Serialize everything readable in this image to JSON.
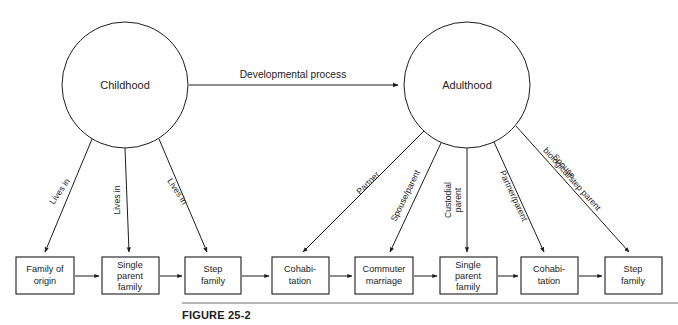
{
  "figure": {
    "caption": "FIGURE 25-2",
    "accent_color": "#1c1c1c",
    "rule_color": "#6f6f6f",
    "background": "#ffffff"
  },
  "nodes": [
    {
      "id": "childhood",
      "label": "Childhood",
      "shape": "circle",
      "cx": 125,
      "cy": 85,
      "r": 63
    },
    {
      "id": "adulthood",
      "label": "Adulthood",
      "shape": "circle",
      "cx": 467,
      "cy": 85,
      "r": 63
    }
  ],
  "main_edge": {
    "label": "Developmental process",
    "from": "childhood",
    "to": "adulthood"
  },
  "boxes": [
    {
      "id": "family-of-origin",
      "lines": [
        "Family of",
        "origin"
      ],
      "x": 16,
      "y": 257,
      "w": 58,
      "h": 37
    },
    {
      "id": "single-parent-1",
      "lines": [
        "Single",
        "parent",
        "family"
      ],
      "x": 102,
      "y": 257,
      "w": 57,
      "h": 37
    },
    {
      "id": "step-family-1",
      "lines": [
        "Step",
        "family"
      ],
      "x": 185,
      "y": 257,
      "w": 56,
      "h": 37
    },
    {
      "id": "cohabitation-1",
      "lines": [
        "Cohabi-",
        "tation"
      ],
      "x": 272,
      "y": 257,
      "w": 57,
      "h": 37
    },
    {
      "id": "commuter-marriage",
      "lines": [
        "Commuter",
        "marriage"
      ],
      "x": 355,
      "y": 257,
      "w": 58,
      "h": 37
    },
    {
      "id": "single-parent-2",
      "lines": [
        "Single",
        "parent",
        "family"
      ],
      "x": 440,
      "y": 257,
      "w": 57,
      "h": 37
    },
    {
      "id": "cohabitation-2",
      "lines": [
        "Cohabi-",
        "tation"
      ],
      "x": 521,
      "y": 257,
      "w": 57,
      "h": 37
    },
    {
      "id": "step-family-2",
      "lines": [
        "Step",
        "family"
      ],
      "x": 605,
      "y": 257,
      "w": 57,
      "h": 37
    }
  ],
  "childhood_edges": [
    {
      "id": "childhood-to-family-of-origin",
      "label": "Lives in",
      "target": "family-of-origin",
      "rotate": -55
    },
    {
      "id": "childhood-to-single-parent",
      "label": "Lives in",
      "target": "single-parent-1",
      "rotate": -90
    },
    {
      "id": "childhood-to-step-family",
      "label": "Lives in",
      "target": "step-family-1",
      "rotate": -57
    }
  ],
  "adulthood_edges": [
    {
      "id": "adulthood-to-cohabitation-1",
      "label": "Partner",
      "target": "cohabitation-1",
      "rotate": -55
    },
    {
      "id": "adulthood-to-commuter-marriage",
      "label": "Spouse/parent",
      "target": "commuter-marriage",
      "rotate": -68
    },
    {
      "id": "adulthood-to-single-parent-2",
      "label": "Custodial parent",
      "target": "single-parent-2",
      "rotate": -90
    },
    {
      "id": "adulthood-to-cohabitation-2",
      "label": "Partner/parent",
      "target": "cohabitation-2",
      "rotate": -68
    },
    {
      "id": "adulthood-to-step-family-2",
      "label": "Spouse biological/step parent",
      "target": "step-family-2",
      "rotate": -48
    }
  ],
  "edge_label_lines": {
    "custodial": [
      "Custodial",
      "parent"
    ],
    "spouse_bio": [
      "Spouse",
      "biological/step parent"
    ]
  },
  "chain_arrows": [
    {
      "id": "chain-1",
      "from": "family-of-origin",
      "to": "single-parent-1"
    },
    {
      "id": "chain-2",
      "from": "single-parent-1",
      "to": "step-family-1"
    },
    {
      "id": "chain-3",
      "from": "step-family-1",
      "to": "cohabitation-1"
    },
    {
      "id": "chain-4",
      "from": "cohabitation-1",
      "to": "commuter-marriage"
    },
    {
      "id": "chain-5",
      "from": "commuter-marriage",
      "to": "single-parent-2"
    },
    {
      "id": "chain-6",
      "from": "single-parent-2",
      "to": "cohabitation-2"
    },
    {
      "id": "chain-7",
      "from": "cohabitation-2",
      "to": "step-family-2"
    }
  ]
}
